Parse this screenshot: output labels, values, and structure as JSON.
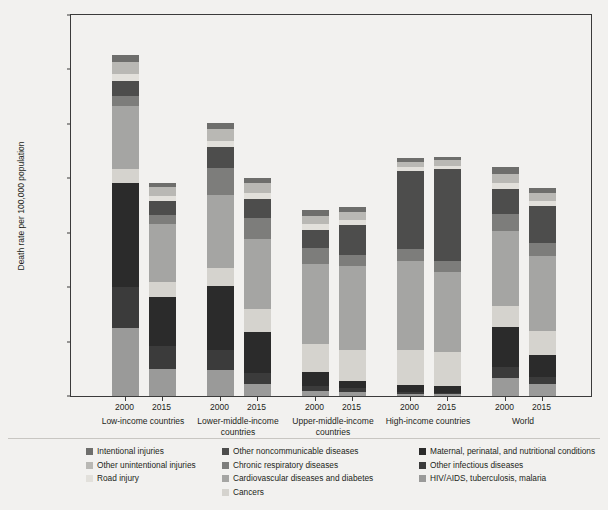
{
  "chart_data": {
    "type": "bar",
    "subtype": "stacked-bar-grouped",
    "title": "",
    "xlabel": "",
    "ylabel": "Death rate per 100,000 population",
    "ylim": [
      0,
      1400
    ],
    "yticks": [
      0,
      200,
      400,
      600,
      800,
      1000,
      1200,
      1400
    ],
    "ytick_labels": [
      "0",
      "200",
      "400",
      "600",
      "800",
      "1,000",
      "1,200",
      "1,400"
    ],
    "grid": false,
    "legend_position": "below-plot",
    "groups": [
      "Low-income countries",
      "Lower-middle-income countries",
      "Upper-middle-income countries",
      "High-income countries",
      "World"
    ],
    "years": [
      "2000",
      "2015"
    ],
    "series": [
      {
        "name": "HIV/AIDS, tuberculosis, malaria",
        "color": "#9a9a99",
        "values": [
          251,
          98,
          96,
          44,
          20,
          16,
          6,
          6,
          65,
          43
        ]
      },
      {
        "name": "Other infectious diseases",
        "color": "#3b3b3b",
        "values": [
          150,
          84,
          72,
          41,
          16,
          13,
          7,
          6,
          43,
          26
        ]
      },
      {
        "name": "Maternal, perinatal, and nutritional conditions",
        "color": "#2b2b2b",
        "values": [
          383,
          181,
          237,
          152,
          51,
          27,
          29,
          24,
          144,
          82
        ]
      },
      {
        "name": "Cancers",
        "color": "#d5d3ce",
        "values": [
          49,
          56,
          65,
          81,
          105,
          113,
          127,
          124,
          80,
          87
        ]
      },
      {
        "name": "Cardiovascular diseases and diabetes",
        "color": "#a5a5a3",
        "values": [
          233,
          212,
          267,
          258,
          293,
          310,
          327,
          295,
          276,
          276
        ]
      },
      {
        "name": "Chronic respiratory diseases",
        "color": "#7d7d7b",
        "values": [
          38,
          35,
          100,
          79,
          60,
          38,
          43,
          40,
          61,
          48
        ]
      },
      {
        "name": "Other noncommunicable diseases",
        "color": "#4d4d4c",
        "values": [
          53,
          50,
          78,
          70,
          66,
          112,
          288,
          341,
          92,
          135
        ]
      },
      {
        "name": "Road injury",
        "color": "#e2e0db",
        "values": [
          25,
          19,
          24,
          22,
          21,
          18,
          13,
          9,
          21,
          19
        ]
      },
      {
        "name": "Other unintentional injuries",
        "color": "#b9b8b4",
        "values": [
          46,
          35,
          42,
          37,
          30,
          29,
          20,
          21,
          35,
          32
        ]
      },
      {
        "name": "Intentional injuries",
        "color": "#6e6e6c",
        "values": [
          26,
          13,
          24,
          19,
          22,
          19,
          15,
          14,
          23,
          17
        ]
      }
    ],
    "bar_totals": [
      1254,
      783,
      1005,
      803,
      684,
      695,
      875,
      880,
      840,
      765
    ]
  },
  "legend": {
    "columns": [
      {
        "items": [
          {
            "label": "Intentional injuries",
            "color": "#6e6e6c"
          },
          {
            "label": "Other unintentional injuries",
            "color": "#b9b8b4"
          },
          {
            "label": "Road injury",
            "color": "#e2e0db"
          }
        ]
      },
      {
        "items": [
          {
            "label": "Other noncommunicable diseases",
            "color": "#4d4d4c"
          },
          {
            "label": "Chronic respiratory diseases",
            "color": "#7d7d7b"
          },
          {
            "label": "Cardiovascular diseases and diabetes",
            "color": "#a5a5a3"
          },
          {
            "label": "Cancers",
            "color": "#d5d3ce"
          }
        ]
      },
      {
        "items": [
          {
            "label": "Maternal, perinatal, and nutritional conditions",
            "color": "#2b2b2b"
          },
          {
            "label": "Other infectious diseases",
            "color": "#3b3b3b"
          },
          {
            "label": "HIV/AIDS, tuberculosis, malaria",
            "color": "#9a9a99"
          }
        ]
      }
    ]
  },
  "axis": {
    "y_title": "Death rate per 100,000 population"
  }
}
